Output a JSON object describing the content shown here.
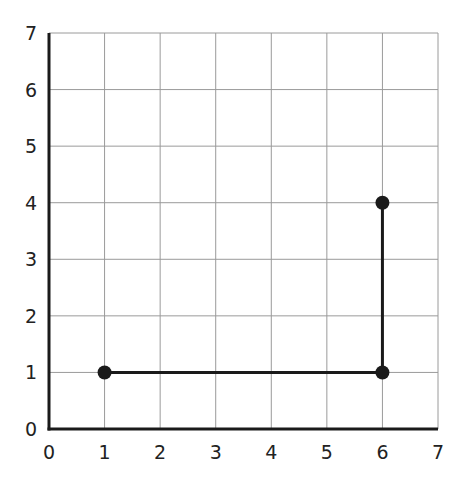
{
  "chart_data": {
    "type": "line",
    "title": "",
    "xlabel": "",
    "ylabel": "",
    "xlim": [
      0,
      7
    ],
    "ylim": [
      0,
      7
    ],
    "grid": true,
    "x_ticks": [
      "0",
      "1",
      "2",
      "3",
      "4",
      "5",
      "6",
      "7"
    ],
    "y_ticks": [
      "0",
      "1",
      "2",
      "3",
      "4",
      "5",
      "6",
      "7"
    ],
    "series": [
      {
        "name": "path",
        "points": [
          [
            1,
            1
          ],
          [
            6,
            1
          ],
          [
            6,
            4
          ]
        ],
        "markers": true
      }
    ]
  },
  "style": {
    "line_color": "#1a1a1a",
    "grid_color": "#9a9a9a",
    "axis_color": "#1a1a1a"
  }
}
